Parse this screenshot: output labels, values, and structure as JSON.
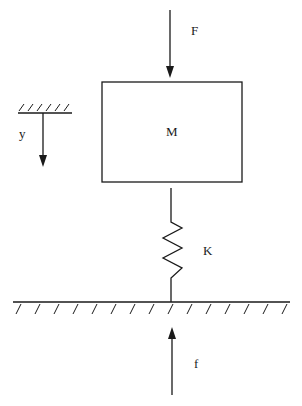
{
  "diagram": {
    "type": "mass-spring system",
    "labels": {
      "applied_force": "F",
      "mass": "M",
      "displacement": "y",
      "spring_constant": "K",
      "ground_force": "f"
    },
    "colors": {
      "stroke": "#1a1a1a",
      "background": "#ffffff"
    }
  }
}
